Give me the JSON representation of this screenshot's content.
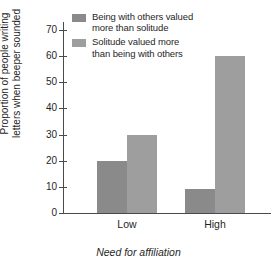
{
  "chart_data": {
    "type": "bar",
    "title": "",
    "subtitle": "",
    "xlabel": "Need for affiliation",
    "ylabel": "Proportion of people writing\nletters when beeper sounded",
    "categories": [
      "Low",
      "High"
    ],
    "series": [
      {
        "name": "Being with others valued\nmore than solitude",
        "values": [
          20,
          9
        ],
        "color": "#8a8a8a"
      },
      {
        "name": "Solitude valued more\nthan being with others",
        "values": [
          30,
          60
        ],
        "color": "#9e9e9e"
      }
    ],
    "ylim": [
      0,
      73
    ],
    "yticks": [
      0,
      10,
      20,
      30,
      40,
      50,
      60,
      70
    ],
    "ytick_labels": [
      "0",
      "10",
      "20",
      "30",
      "40",
      "50",
      "60",
      "70"
    ],
    "grid": false,
    "legend_position": "top-right",
    "axis_color": "#4a4a4a",
    "background": "#ffffff"
  },
  "legend": {
    "entries": [
      {
        "label": "Being with others valued\nmore than solitude"
      },
      {
        "label": "Solitude valued more\nthan being with others"
      }
    ]
  },
  "axes": {
    "x_category_labels": [
      "Low",
      "High"
    ],
    "x_axis_title": "Need for affiliation",
    "y_axis_title": "Proportion of people writing\nletters when beeper sounded",
    "y_tick_labels": [
      "0",
      "10",
      "20",
      "30",
      "40",
      "50",
      "60",
      "70"
    ]
  }
}
